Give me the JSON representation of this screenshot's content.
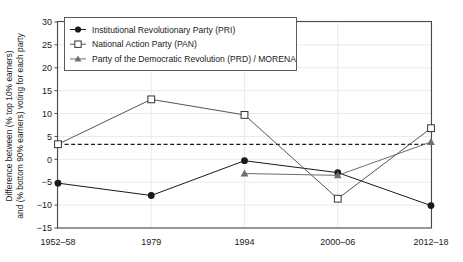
{
  "chart_data": {
    "type": "line",
    "title": "",
    "xlabel": "",
    "ylabel": "Difference between (% top 10% earners) and (% bottom 90% earners) voting for each party",
    "ylabel_line1": "Difference between (% top 10% earners)",
    "ylabel_line2": "and (% bottom 90% earners) voting for each party",
    "categories": [
      "1952–58",
      "1979",
      "1994",
      "2000–06",
      "2012–18"
    ],
    "ylim": [
      -15,
      30
    ],
    "yticks": [
      30,
      25,
      20,
      15,
      10,
      5,
      0,
      -5,
      -10,
      -15
    ],
    "ytick_labels": [
      "30",
      "25",
      "20",
      "15",
      "10",
      "5",
      "0",
      "−5",
      "−10",
      "−15"
    ],
    "grid": true,
    "legend_position": "top-left-inside",
    "zero_reference_line": 0,
    "series": [
      {
        "name": "Institutional Revolutionary Party (PRI)",
        "marker": "filled-circle",
        "color": "#1a1a1a",
        "values": [
          -5.2,
          -7.9,
          -0.3,
          -2.9,
          -10.1
        ]
      },
      {
        "name": "National Action Party (PAN)",
        "marker": "open-square",
        "color": "#555555",
        "values": [
          3.3,
          13.1,
          9.7,
          -8.6,
          6.8
        ]
      },
      {
        "name": "Party of the Democratic Revolution (PRD) / MORENA",
        "marker": "filled-triangle",
        "color": "#6e6e6e",
        "values": [
          null,
          null,
          -3.1,
          -3.5,
          3.8
        ]
      }
    ]
  },
  "legend": {
    "entries": [
      "Institutional Revolutionary Party (PRI)",
      "National Action Party (PAN)",
      "Party of the Democratic Revolution (PRD) / MORENA"
    ]
  }
}
